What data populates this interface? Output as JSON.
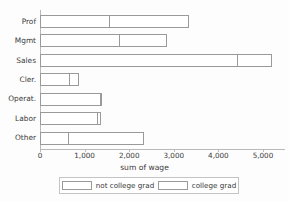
{
  "chart_data": {
    "type": "bar",
    "orientation": "horizontal",
    "stacked": true,
    "title": "",
    "xlabel": "sum of wage",
    "ylabel": "",
    "xlim": [
      0,
      5450
    ],
    "xticks": [
      0,
      1000,
      2000,
      3000,
      4000,
      5000
    ],
    "xticklabels": [
      "0",
      "1,000",
      "2,000",
      "3,000",
      "4,000",
      "5,000"
    ],
    "grid": false,
    "legend_position": "bottom",
    "categories": [
      "Prof",
      "Mgmt",
      "Sales",
      "Cler.",
      "Operat.",
      "Labor",
      "Other"
    ],
    "series": [
      {
        "name": "not college grad",
        "values": [
          1570,
          1795,
          4440,
          670,
          1370,
          1295,
          640
        ]
      },
      {
        "name": "college grad",
        "values": [
          1795,
          1075,
          780,
          230,
          20,
          105,
          1705
        ]
      }
    ],
    "totals": [
      3365,
      2870,
      5220,
      900,
      1390,
      1400,
      2345
    ]
  },
  "legend": {
    "entries": [
      {
        "label": "not college grad"
      },
      {
        "label": "college grad"
      }
    ]
  },
  "colors": {
    "background": "#fdfdfd",
    "bar_fill": "#ffffff",
    "bar_border": "#9a9a9a",
    "axis": "#b9b9b9",
    "text": "#3a3a3a"
  }
}
